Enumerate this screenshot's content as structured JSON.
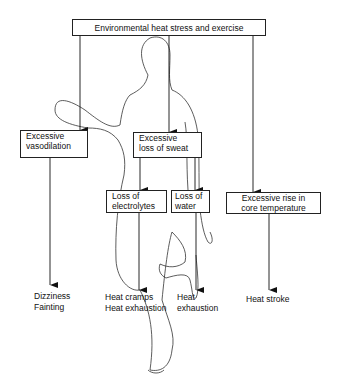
{
  "diagram": {
    "root": {
      "label": "Environmental heat stress and exercise"
    },
    "nodes": [
      {
        "id": "vasodilation",
        "line1": "Excessive",
        "line2": "vasodilation"
      },
      {
        "id": "sweat",
        "line1": "Excessive",
        "line2": "loss of sweat"
      },
      {
        "id": "electrolytes",
        "line1": "Loss of",
        "line2": "electrolytes"
      },
      {
        "id": "water",
        "line1": "Loss of",
        "line2": "water"
      },
      {
        "id": "core_temp",
        "line1": "Excessive rise in",
        "line2": "core temperature"
      }
    ],
    "outcomes": [
      {
        "id": "vasodilation_outcome",
        "line1": "Dizziness",
        "line2": "Fainting"
      },
      {
        "id": "electrolytes_outcome",
        "line1": "Heat cramps",
        "line2": "Heat exhaustion"
      },
      {
        "id": "water_outcome",
        "line1": "Heat",
        "line2": "exhaustion"
      },
      {
        "id": "core_temp_outcome",
        "line1": "Heat stroke",
        "line2": ""
      }
    ],
    "edges": [
      [
        "root",
        "vasodilation"
      ],
      [
        "root",
        "sweat"
      ],
      [
        "root",
        "core_temp"
      ],
      [
        "sweat",
        "electrolytes"
      ],
      [
        "sweat",
        "water"
      ],
      [
        "vasodilation",
        "vasodilation_outcome"
      ],
      [
        "electrolytes",
        "electrolytes_outcome"
      ],
      [
        "water",
        "water_outcome"
      ],
      [
        "core_temp",
        "core_temp_outcome"
      ]
    ]
  }
}
